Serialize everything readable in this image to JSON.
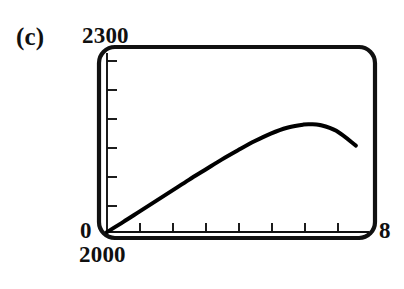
{
  "panel": {
    "label": "(c)"
  },
  "axis_labels": {
    "y_max": "2300",
    "y_min": "0",
    "x_min": "2000",
    "x_max": "8"
  },
  "chart_data": {
    "type": "line",
    "title": "(c)",
    "xlabel": "",
    "ylabel": "",
    "xlim": [
      2000,
      2008
    ],
    "ylim": [
      0,
      2300
    ],
    "x_tick_labels": [
      "2000",
      "8"
    ],
    "y_tick_labels": [
      "0",
      "2300"
    ],
    "n_x_ticks_interior": 7,
    "n_y_ticks_interior": 6,
    "grid": false,
    "legend": false,
    "frame": "rounded-box",
    "tick_direction": "in",
    "line_color": "#000000",
    "series": [
      {
        "name": "curve",
        "x": [
          2000.0,
          2000.5,
          2001.0,
          2001.5,
          2002.0,
          2002.5,
          2003.0,
          2003.5,
          2004.0,
          2004.5,
          2005.0,
          2005.5,
          2006.0,
          2006.2,
          2006.5,
          2007.0,
          2007.6
        ],
        "values": [
          0,
          130,
          265,
          400,
          535,
          670,
          800,
          930,
          1050,
          1165,
          1265,
          1340,
          1380,
          1385,
          1375,
          1300,
          1110
        ]
      }
    ]
  }
}
